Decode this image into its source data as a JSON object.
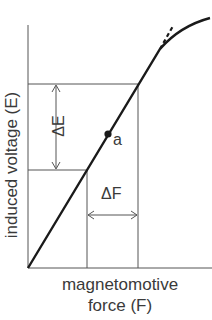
{
  "diagram": {
    "y_axis_label": "induced voltage (E)",
    "x_axis_label_line1": "magnetomotive",
    "x_axis_label_line2": "force (F)",
    "delta_e_label": "ΔE",
    "delta_f_label": "ΔF",
    "point_label": "a",
    "colors": {
      "curve": "#1a1a1a",
      "lines": "#555555",
      "text": "#3a3a3a"
    }
  }
}
